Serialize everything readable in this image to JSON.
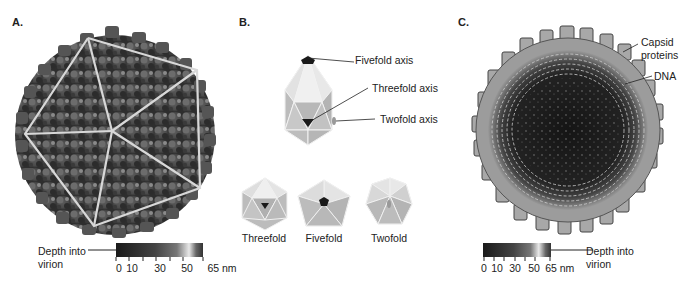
{
  "panels": {
    "a": {
      "label": "A.",
      "scale": {
        "caption_line1": "Depth into",
        "caption_line2": "virion",
        "ticks": [
          "0",
          "10",
          "30",
          "50",
          "65 nm"
        ]
      }
    },
    "b": {
      "label": "B.",
      "callouts": {
        "fivefold_axis": "Fivefold axis",
        "threefold_axis": "Threefold axis",
        "twofold_axis": "Twofold axis"
      },
      "views": [
        {
          "label": "Threefold"
        },
        {
          "label": "Fivefold"
        },
        {
          "label": "Twofold"
        }
      ]
    },
    "c": {
      "label": "C.",
      "callouts": {
        "capsid_line1": "Capsid",
        "capsid_line2": "proteins",
        "dna": "DNA"
      },
      "scale": {
        "caption_line1": "Depth into",
        "caption_line2": "virion",
        "ticks": [
          "0",
          "10",
          "30",
          "50",
          "65",
          "nm"
        ]
      }
    }
  },
  "colors": {
    "capsid_dark": "#3a3a3a",
    "capsid_mid": "#6e6e6e",
    "capsid_light": "#b8b8b8",
    "icosa_face": "#c8c8c8",
    "icosa_face_light": "#e4e4e4",
    "icosa_edge": "#f2f2f2",
    "axis_marker": "#1a1a1a",
    "overlay_lines": "#d8d8d8"
  }
}
